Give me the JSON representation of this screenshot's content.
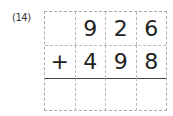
{
  "problem": {
    "label": "(14)",
    "rows": [
      [
        "",
        "9",
        "2",
        "6"
      ],
      [
        "+",
        "4",
        "9",
        "8"
      ],
      [
        "",
        "",
        "",
        ""
      ]
    ]
  }
}
